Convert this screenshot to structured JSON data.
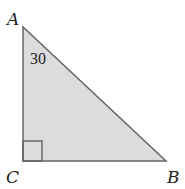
{
  "diagram": {
    "type": "right-triangle",
    "vertices": [
      {
        "name": "A",
        "label": "A"
      },
      {
        "name": "B",
        "label": "B"
      },
      {
        "name": "C",
        "label": "C"
      }
    ],
    "angle_label": "30",
    "right_angle_at": "C",
    "colors": {
      "fill": "#dcdcdc",
      "stroke": "#666666"
    }
  }
}
